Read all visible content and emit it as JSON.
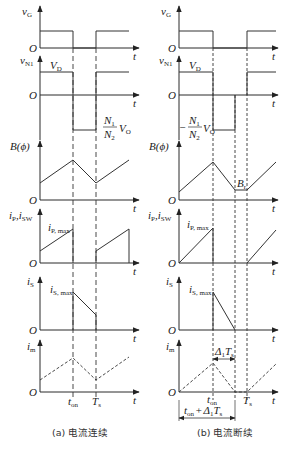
{
  "figure": {
    "panels": [
      {
        "id": "a",
        "caption": "(a) 电流连续",
        "mode": "continuous conduction"
      },
      {
        "id": "b",
        "caption": "(b) 电流断续",
        "mode": "discontinuous conduction"
      }
    ],
    "labels": {
      "origin": "O",
      "t_axis": "t",
      "vG": "v",
      "vG_sub": "G",
      "vN1": "v",
      "vN1_sub": "N1",
      "VD": "V",
      "VD_sub": "D",
      "ratio_num": "N",
      "ratio_num_sub": "1",
      "ratio_den": "N",
      "ratio_den_sub": "2",
      "VO": "V",
      "VO_sub": "O",
      "minus": "−",
      "B": "B(ϕ)",
      "ip": "i",
      "ip_sub": "P",
      "comma": ",",
      "isw": "i",
      "isw_sub": "SW",
      "ipmax": "i",
      "ipmax_sub": "P, max",
      "is": "i",
      "is_sub": "S",
      "ismax": "i",
      "ismax_sub": "S, max",
      "im": "i",
      "im_sub": "m",
      "ton": "t",
      "ton_sub": "on",
      "Ts": "T",
      "Ts_sub": "s",
      "Br": "B",
      "Br_sub": "r",
      "delta": "Δ",
      "delta_sub": "1",
      "plus": "+"
    },
    "waveforms": [
      "v_G",
      "v_N1",
      "B(ϕ)",
      "i_P, i_SW",
      "i_S",
      "i_m"
    ]
  }
}
